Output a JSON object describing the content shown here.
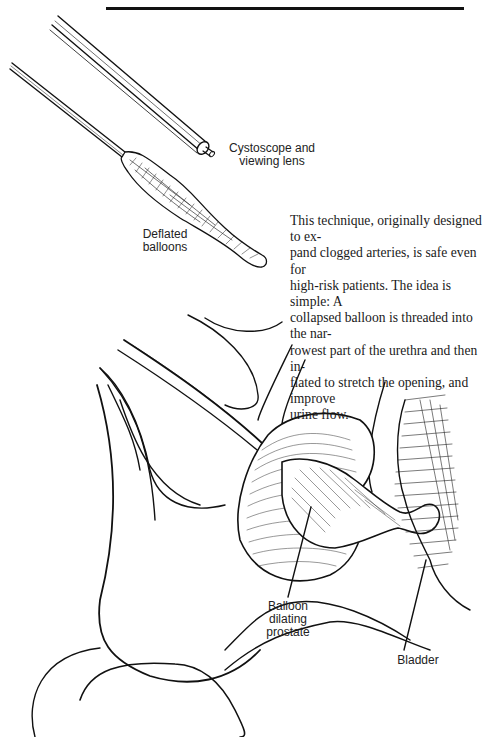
{
  "page": {
    "header_rule": true
  },
  "figure_top": {
    "labels": {
      "cystoscope": "Cystoscope and\nviewing lens",
      "cystoscope_line1": "Cystoscope and",
      "cystoscope_line2": "viewing lens",
      "balloons_line1": "Deflated",
      "balloons_line2": "balloons"
    }
  },
  "body_text": {
    "paragraph": "This technique, originally designed to expand clogged arteries, is safe even for high-risk patients. The idea is simple: A collapsed balloon is threaded into the narrowest part of the urethra and then inflated to stretch the opening, and improve urine flow.",
    "lines": [
      "This technique, originally designed to ex-",
      "pand clogged arteries, is safe even for",
      "high-risk patients. The idea is simple: A",
      "collapsed balloon is threaded into the nar-",
      "rowest part of the urethra and then in-",
      "flated to stretch the opening, and improve",
      "urine flow."
    ]
  },
  "figure_bottom": {
    "labels": {
      "balloon_line1": "Balloon",
      "balloon_line2": "dilating",
      "balloon_line3": "prostate",
      "bladder": "Bladder"
    }
  }
}
